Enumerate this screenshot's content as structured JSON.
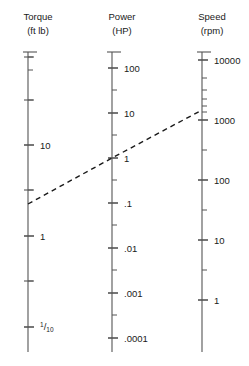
{
  "figure": {
    "kind": "nomogram",
    "background_color": "#ffffff",
    "axis_color": "#555555",
    "text_color": "#1a1a1a",
    "index_line_color": "#1a1a1a"
  },
  "chart_data": {
    "type": "line",
    "title": "",
    "xlabel": "",
    "ylabel": "",
    "grid": false,
    "legend": "none",
    "scales": [
      {
        "id": "torque",
        "title": "Torque",
        "unit": "(ft lb)",
        "scale": "log",
        "x_px": 28,
        "top_px": 52,
        "bottom_px": 352,
        "labeled_ticks": [
          {
            "text": "10",
            "value": 10,
            "y_px": 145
          },
          {
            "text": "1",
            "value": 1,
            "y_px": 236
          },
          {
            "text": "1/10",
            "value": 0.1,
            "y_px": 327,
            "is_fraction": true,
            "numerator": "1",
            "denominator": "10"
          }
        ],
        "minor_ticks_px": [
          57,
          70,
          100,
          190,
          281
        ],
        "major_ticks_px": [
          57,
          100,
          145,
          190,
          236,
          281,
          327
        ]
      },
      {
        "id": "power",
        "title": "Power",
        "unit": "(HP)",
        "scale": "log",
        "x_px": 112,
        "top_px": 52,
        "bottom_px": 352,
        "labeled_ticks": [
          {
            "text": "100",
            "value": 100,
            "y_px": 68
          },
          {
            "text": "10",
            "value": 10,
            "y_px": 113
          },
          {
            "text": "1",
            "value": 1,
            "y_px": 158
          },
          {
            "text": ".1",
            "value": 0.1,
            "y_px": 203
          },
          {
            "text": ".01",
            "value": 0.01,
            "y_px": 248
          },
          {
            "text": ".001",
            "value": 0.001,
            "y_px": 293
          },
          {
            "text": ".0001",
            "value": 0.0001,
            "y_px": 338
          }
        ],
        "minor_ticks_px": [
          90,
          135,
          180,
          225,
          270,
          315
        ],
        "major_ticks_px": [
          68,
          113,
          158,
          203,
          248,
          293,
          338
        ]
      },
      {
        "id": "speed",
        "title": "Speed",
        "unit": "(rpm)",
        "scale": "log",
        "x_px": 202,
        "top_px": 52,
        "bottom_px": 352,
        "labeled_ticks": [
          {
            "text": "10000",
            "value": 10000,
            "y_px": 60
          },
          {
            "text": "1000",
            "value": 1000,
            "y_px": 120
          },
          {
            "text": "100",
            "value": 100,
            "y_px": 180
          },
          {
            "text": "10",
            "value": 10,
            "y_px": 240
          },
          {
            "text": "1",
            "value": 1,
            "y_px": 300
          }
        ],
        "minor_ticks_px": [
          78,
          90,
          99,
          106,
          112,
          150,
          210,
          270
        ],
        "major_ticks_px": [
          60,
          120,
          180,
          240,
          300
        ]
      }
    ],
    "index_line": {
      "label": "alignment line",
      "style": "dashed",
      "points_px": [
        {
          "x": 28,
          "y": 204
        },
        {
          "x": 112,
          "y": 158
        },
        {
          "x": 202,
          "y": 110
        }
      ],
      "readings": [
        {
          "scale": "torque",
          "value": 3.5,
          "unit": "ft lb"
        },
        {
          "scale": "power",
          "value": 1,
          "unit": "HP"
        },
        {
          "scale": "speed",
          "value": 1500,
          "unit": "rpm"
        }
      ]
    }
  }
}
